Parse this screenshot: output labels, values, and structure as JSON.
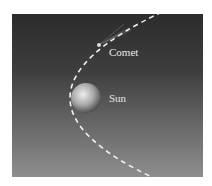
{
  "diagram": {
    "labels": {
      "comet": "Comet",
      "sun": "Sun"
    },
    "colors": {
      "background_top": "#2c2c2c",
      "background_bottom": "#8e8e8e",
      "orbit": "#f2f2f2",
      "label": "#e8e8e8",
      "sun_highlight": "#e6e6e6",
      "sun_shadow": "#5a5a5a"
    },
    "elements": [
      {
        "type": "orbit-path",
        "shape": "parabola",
        "style": "dashed"
      },
      {
        "type": "body",
        "name": "Comet"
      },
      {
        "type": "body",
        "name": "Sun"
      }
    ]
  }
}
